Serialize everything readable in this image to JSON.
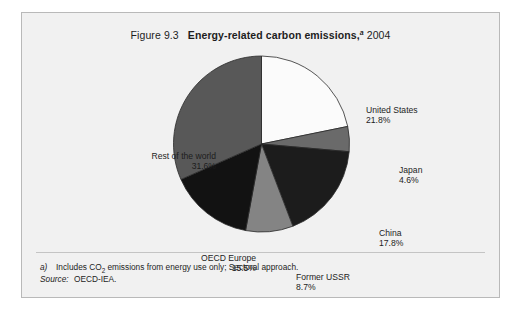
{
  "figure": {
    "number": "Figure 9.3",
    "title": "Energy-related carbon emissions,",
    "footnote_marker": "a",
    "year": "2004",
    "panel_background": "#f1f1f1",
    "panel_border": "#b9b9b9"
  },
  "notes": {
    "footnote_marker": "a)",
    "footnote_text_before": "Includes CO",
    "footnote_subscript": "2",
    "footnote_text_after": " emissions from energy use only; Sectoral approach.",
    "footnote_full": "a)   Includes CO2 emissions from energy use only; Sectoral approach.",
    "source_label": "Source:",
    "source_value": "OECD-IEA."
  },
  "chart_data": {
    "type": "pie",
    "xlabel": "",
    "ylabel": "",
    "units": "percent",
    "total": 100.0,
    "start_angle_deg": 0,
    "direction": "clockwise",
    "legend": "none (direct labels)",
    "grid": false,
    "categories": [
      "United States",
      "Japan",
      "China",
      "Former USSR",
      "OECD Europe",
      "Rest of the world"
    ],
    "values": [
      21.8,
      4.6,
      17.8,
      8.7,
      15.5,
      31.6
    ],
    "slices": [
      {
        "name": "United States",
        "value": 21.8,
        "label_value": "21.8%",
        "color": "#fbfbfb",
        "start_deg": 0.0,
        "end_deg": 78.48
      },
      {
        "name": "Japan",
        "value": 4.6,
        "label_value": "4.6%",
        "color": "#6a6a6a",
        "start_deg": 78.48,
        "end_deg": 95.04
      },
      {
        "name": "China",
        "value": 17.8,
        "label_value": "17.8%",
        "color": "#1c1c1c",
        "start_deg": 95.04,
        "end_deg": 159.12
      },
      {
        "name": "Former USSR",
        "value": 8.7,
        "label_value": "8.7%",
        "color": "#848484",
        "start_deg": 159.12,
        "end_deg": 190.44
      },
      {
        "name": "OECD Europe",
        "value": 15.5,
        "label_value": "15.5%",
        "color": "#121212",
        "start_deg": 190.44,
        "end_deg": 246.24
      },
      {
        "name": "Rest of the world",
        "value": 31.6,
        "label_value": "31.6%",
        "color": "#585858",
        "start_deg": 246.24,
        "end_deg": 360.0
      }
    ]
  },
  "labels": {
    "united_states": {
      "name": "United States",
      "value": "21.8%"
    },
    "japan": {
      "name": "Japan",
      "value": "4.6%"
    },
    "china": {
      "name": "China",
      "value": "17.8%"
    },
    "former_ussr": {
      "name": "Former USSR",
      "value": "8.7%"
    },
    "oecd_europe": {
      "name": "OECD Europe",
      "value": "15.5%"
    },
    "rest_of_world": {
      "name": "Rest of the world",
      "value": "31.6%"
    }
  }
}
